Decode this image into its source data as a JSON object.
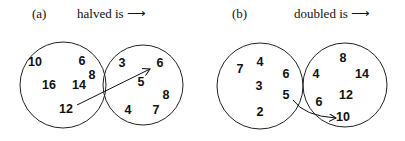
{
  "diagrams": [
    {
      "id": "a",
      "label": "(a)",
      "relation": "halved is ⟶",
      "left_set": [
        {
          "v": "10",
          "x": 35,
          "y": 66
        },
        {
          "v": "6",
          "x": 82,
          "y": 65
        },
        {
          "v": "8",
          "x": 92,
          "y": 79
        },
        {
          "v": "16",
          "x": 49,
          "y": 89
        },
        {
          "v": "14",
          "x": 79,
          "y": 89
        },
        {
          "v": "12",
          "x": 66,
          "y": 113
        }
      ],
      "right_set": [
        {
          "v": "3",
          "x": 122,
          "y": 67
        },
        {
          "v": "6",
          "x": 160,
          "y": 67
        },
        {
          "v": "5",
          "x": 141,
          "y": 86
        },
        {
          "v": "8",
          "x": 166,
          "y": 99
        },
        {
          "v": "4",
          "x": 128,
          "y": 114
        },
        {
          "v": "7",
          "x": 156,
          "y": 114
        }
      ],
      "arrow": {
        "from": "12",
        "to": "6"
      }
    },
    {
      "id": "b",
      "label": "(b)",
      "relation": "doubled is ⟶",
      "left_set": [
        {
          "v": "7",
          "x": 240,
          "y": 73
        },
        {
          "v": "4",
          "x": 260,
          "y": 66
        },
        {
          "v": "6",
          "x": 286,
          "y": 78
        },
        {
          "v": "3",
          "x": 259,
          "y": 90
        },
        {
          "v": "5",
          "x": 286,
          "y": 99
        },
        {
          "v": "2",
          "x": 260,
          "y": 116
        }
      ],
      "right_set": [
        {
          "v": "8",
          "x": 343,
          "y": 62
        },
        {
          "v": "4",
          "x": 316,
          "y": 78
        },
        {
          "v": "14",
          "x": 362,
          "y": 78
        },
        {
          "v": "12",
          "x": 346,
          "y": 99
        },
        {
          "v": "6",
          "x": 319,
          "y": 106
        },
        {
          "v": "10",
          "x": 343,
          "y": 121
        }
      ],
      "arrow": {
        "from": "5",
        "to": "10"
      }
    }
  ]
}
